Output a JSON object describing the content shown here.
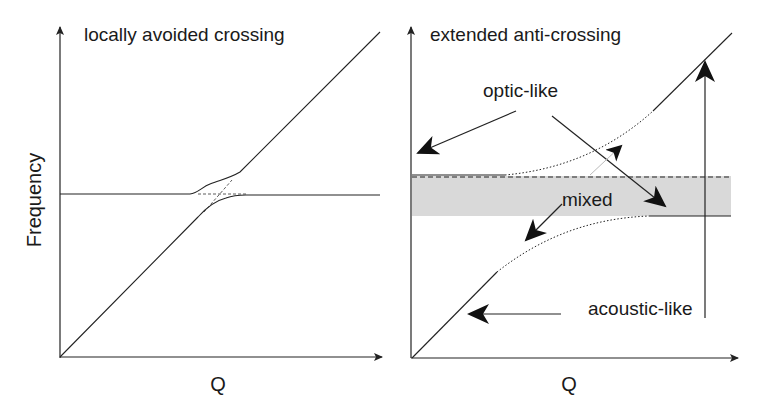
{
  "left_panel": {
    "title": "locally avoided crossing",
    "ylabel": "Frequency",
    "xlabel": "Q"
  },
  "right_panel": {
    "title": "extended anti-crossing",
    "xlabel": "Q",
    "labels": {
      "optic": "optic-like",
      "mixed": "mixed",
      "acoustic": "acoustic-like"
    }
  },
  "colors": {
    "line": "#222222",
    "band": "#d9d9d9",
    "faint_arrow": "#bbbbbb"
  }
}
